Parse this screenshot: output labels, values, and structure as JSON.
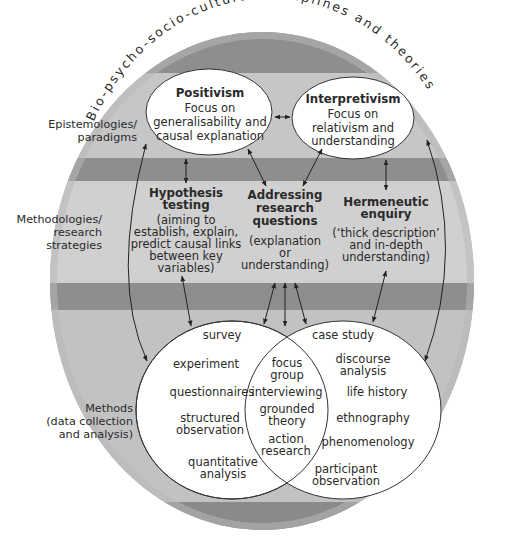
{
  "diagram": {
    "arc_title": "Bio-psycho-socio-cultural disciplines and theories",
    "side_labels": {
      "epistemologies": [
        "Epistemologies/",
        "paradigms"
      ],
      "methodologies": [
        "Methodologies/",
        "research",
        "strategies"
      ],
      "methods": [
        "Methods",
        "(data collection",
        "and analysis)"
      ]
    },
    "paradigms": {
      "positivism": {
        "title": "Positivism",
        "lines": [
          "Focus on",
          "generalisability and",
          "causal explanation"
        ]
      },
      "interpretivism": {
        "title": "Interpretivism",
        "lines": [
          "Focus on",
          "relativism and",
          "understanding"
        ]
      }
    },
    "strategies": {
      "hypothesis": {
        "title": [
          "Hypothesis",
          "testing"
        ],
        "lines": [
          "(aiming to",
          "establish, explain,",
          "predict causal links",
          "between key",
          "variables)"
        ]
      },
      "addressing": {
        "title": [
          "Addressing",
          "research",
          "questions"
        ],
        "lines": [
          "(explanation",
          "or",
          "understanding)"
        ]
      },
      "hermeneutic": {
        "title": [
          "Hermeneutic",
          "enquiry"
        ],
        "lines": [
          "(‘thick description’",
          "and in-depth",
          "understanding)"
        ]
      }
    },
    "methods": {
      "quantitative": [
        [
          "survey"
        ],
        [
          "experiment"
        ],
        [
          "questionnaires"
        ],
        [
          "structured",
          "observation"
        ],
        [
          "quantitative",
          "analysis"
        ]
      ],
      "shared": [
        [
          "focus",
          "group"
        ],
        [
          "interviewing"
        ],
        [
          "grounded",
          "theory"
        ],
        [
          "action",
          "research"
        ]
      ],
      "qualitative": [
        [
          "case study"
        ],
        [
          "discourse",
          "analysis"
        ],
        [
          "life history"
        ],
        [
          "ethnography"
        ],
        [
          "phenomenology"
        ],
        [
          "participant",
          "observation"
        ]
      ]
    },
    "colors": {
      "dark_band": "#8c8c8c",
      "light_band": "#c4c4c4",
      "outer_ring": "#b3b3b3",
      "ellipse_fill": "#ffffff",
      "line": "#333333"
    }
  }
}
